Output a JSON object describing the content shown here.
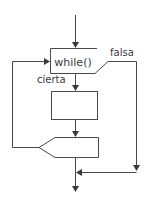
{
  "diagram": {
    "type": "flowchart",
    "nodes": [
      {
        "id": "cond",
        "shape": "open-decision-box",
        "label": "while()"
      },
      {
        "id": "body",
        "shape": "rectangle",
        "label": ""
      },
      {
        "id": "loopback",
        "shape": "pentagon-connector",
        "label": ""
      }
    ],
    "edges": [
      {
        "from": "entry",
        "to": "cond",
        "label": ""
      },
      {
        "from": "cond",
        "to": "body",
        "label": "cierta"
      },
      {
        "from": "cond",
        "to": "exit",
        "label": "falsa"
      },
      {
        "from": "body",
        "to": "loopback",
        "label": ""
      },
      {
        "from": "loopback",
        "to": "cond",
        "label": ""
      }
    ],
    "labels": {
      "condition": "while()",
      "true_branch": "cierta",
      "false_branch": "falsa"
    },
    "colors": {
      "line": "#4a4a4a",
      "text": "#3a3a3a",
      "background": "#ffffff"
    }
  }
}
